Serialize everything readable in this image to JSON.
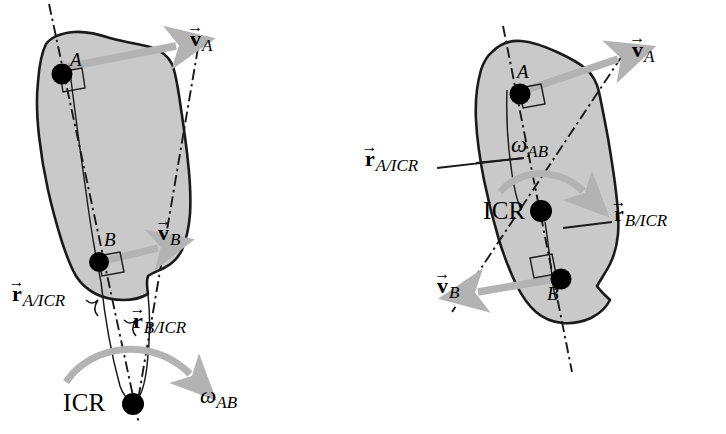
{
  "figure": {
    "background_color": "#ffffff",
    "body_fill_color": "#c9c9c9",
    "body_outline_color": "#1a1a1a",
    "velocity_arrow_color": "#b3b3b3",
    "omega_arrow_color": "#b3b3b3",
    "construction_line_color": "#1a1a1a",
    "point_marker_color": "#000000"
  },
  "panels": [
    {
      "id": "left-panel",
      "name": "icr-outside-body",
      "description": "ICR located outside the rigid body, below it",
      "points": [
        {
          "id": "A",
          "label": "A"
        },
        {
          "id": "B",
          "label": "B"
        },
        {
          "id": "ICR",
          "label": "ICR"
        }
      ],
      "vectors": [
        {
          "id": "vA",
          "letter": "v",
          "subscript": "A",
          "arrow_over": "→"
        },
        {
          "id": "vB",
          "letter": "v",
          "subscript": "B",
          "arrow_over": "→"
        },
        {
          "id": "rAICR",
          "letter": "r",
          "subscript": "A/ICR",
          "arrow_over": "→"
        },
        {
          "id": "rBICR",
          "letter": "r",
          "subscript": "B/ICR",
          "arrow_over": "→"
        }
      ],
      "angular_velocity": {
        "symbol": "ω",
        "subscript": "AB"
      }
    },
    {
      "id": "right-panel",
      "name": "icr-inside-body",
      "description": "ICR located inside the rigid body, between A and B",
      "points": [
        {
          "id": "A",
          "label": "A"
        },
        {
          "id": "B",
          "label": "B"
        },
        {
          "id": "ICR",
          "label": "ICR"
        }
      ],
      "vectors": [
        {
          "id": "vA",
          "letter": "v",
          "subscript": "A",
          "arrow_over": "→"
        },
        {
          "id": "vB",
          "letter": "v",
          "subscript": "B",
          "arrow_over": "→"
        },
        {
          "id": "rAICR",
          "letter": "r",
          "subscript": "A/ICR",
          "arrow_over": "→"
        },
        {
          "id": "rBICR",
          "letter": "r",
          "subscript": "B/ICR",
          "arrow_over": "→"
        }
      ],
      "angular_velocity": {
        "symbol": "ω",
        "subscript": "AB"
      }
    }
  ],
  "labels": {
    "left": {
      "pointA": "A",
      "pointB": "B",
      "icr": "ICR",
      "vA_letter": "v",
      "vA_sub": "A",
      "vA_arrow": "→",
      "vB_letter": "v",
      "vB_sub": "B",
      "vB_arrow": "→",
      "rA_letter": "r",
      "rA_sub": "A/ICR",
      "rA_arrow": "→",
      "rB_letter": "r",
      "rB_sub": "B/ICR",
      "rB_arrow": "→",
      "omega_symbol": "ω",
      "omega_sub": "AB"
    },
    "right": {
      "pointA": "A",
      "pointB": "B",
      "icr": "ICR",
      "vA_letter": "v",
      "vA_sub": "A",
      "vA_arrow": "→",
      "vB_letter": "v",
      "vB_sub": "B",
      "vB_arrow": "→",
      "rA_letter": "r",
      "rA_sub": "A/ICR",
      "rA_arrow": "→",
      "rB_letter": "r",
      "rB_sub": "B/ICR",
      "rB_arrow": "→",
      "omega_symbol": "ω",
      "omega_sub": "AB"
    }
  }
}
